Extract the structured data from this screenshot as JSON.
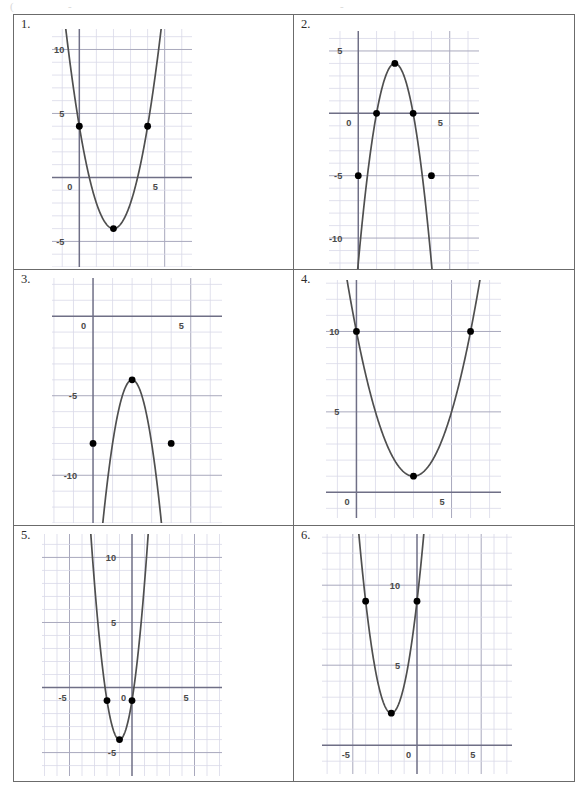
{
  "worksheet": {
    "title": "Quadratic Graphs Worksheet",
    "columns": 2,
    "rows": 3
  },
  "problems": [
    {
      "number": "1.",
      "x_labels": [
        {
          "text": "0",
          "value": 0
        },
        {
          "text": "5",
          "value": 5
        }
      ],
      "y_labels": [
        {
          "text": "10",
          "value": 10
        },
        {
          "text": "5",
          "value": 5
        },
        {
          "text": "-5",
          "value": -5
        }
      ]
    },
    {
      "number": "2.",
      "x_labels": [
        {
          "text": "0",
          "value": 0
        },
        {
          "text": "5",
          "value": 5
        }
      ],
      "y_labels": [
        {
          "text": "5",
          "value": 5
        },
        {
          "text": "-5",
          "value": -5
        },
        {
          "text": "-10",
          "value": -10
        }
      ]
    },
    {
      "number": "3.",
      "x_labels": [
        {
          "text": "0",
          "value": 0
        },
        {
          "text": "5",
          "value": 5
        }
      ],
      "y_labels": [
        {
          "text": "-5",
          "value": -5
        },
        {
          "text": "-10",
          "value": -10
        }
      ]
    },
    {
      "number": "4.",
      "x_labels": [
        {
          "text": "0",
          "value": 0
        },
        {
          "text": "5",
          "value": 5
        }
      ],
      "y_labels": [
        {
          "text": "10",
          "value": 10
        },
        {
          "text": "5",
          "value": 5
        }
      ]
    },
    {
      "number": "5.",
      "x_labels": [
        {
          "text": "-5",
          "value": -5
        },
        {
          "text": "0",
          "value": 0
        },
        {
          "text": "5",
          "value": 5
        }
      ],
      "y_labels": [
        {
          "text": "10",
          "value": 10
        },
        {
          "text": "5",
          "value": 5
        },
        {
          "text": "-5",
          "value": -5
        }
      ]
    },
    {
      "number": "6.",
      "x_labels": [
        {
          "text": "-5",
          "value": -5
        },
        {
          "text": "0",
          "value": 0
        },
        {
          "text": "5",
          "value": 5
        }
      ],
      "y_labels": [
        {
          "text": "10",
          "value": 10
        },
        {
          "text": "5",
          "value": 5
        }
      ]
    }
  ],
  "style": {
    "curve_color": "#4f4f4f",
    "point_color": "#000000",
    "axis_color": "#6f6f86",
    "major_grid_color": "#a9a9bd",
    "minor_grid_color": "#d9d9e8",
    "border_color": "#6b6b6b"
  },
  "chart_data": [
    {
      "type": "line",
      "title": "1.",
      "curve": "parabola",
      "orientation": "opens-up",
      "vertex": [
        2,
        -4
      ],
      "a": 2,
      "equation": "y = 2(x - 2)^2 - 4",
      "points": [
        [
          0,
          4
        ],
        [
          4,
          4
        ],
        [
          2,
          -4
        ]
      ],
      "xlim": [
        -1.6,
        6.6
      ],
      "ylim": [
        -7.0,
        11.6
      ],
      "xlabel": "",
      "ylabel": "",
      "grid": true,
      "grid_step": 1,
      "major_step": 5
    },
    {
      "type": "line",
      "title": "2.",
      "curve": "parabola",
      "orientation": "opens-down",
      "vertex": [
        2,
        4
      ],
      "a": -4,
      "equation": "y = -4(x - 2)^2 + 4",
      "points": [
        [
          1,
          0
        ],
        [
          3,
          0
        ],
        [
          0,
          -5
        ],
        [
          4,
          -5
        ],
        [
          2,
          4
        ]
      ],
      "xlim": [
        -1.6,
        6.6
      ],
      "ylim": [
        -12.8,
        6.6
      ],
      "xlabel": "",
      "ylabel": "",
      "grid": true,
      "grid_step": 1,
      "major_step": 5
    },
    {
      "type": "line",
      "title": "3.",
      "curve": "parabola",
      "orientation": "opens-down",
      "vertex": [
        2,
        -4
      ],
      "a": -4,
      "equation": "y = -4(x - 2)^2 - 4",
      "points": [
        [
          0,
          -8
        ],
        [
          4,
          -8
        ],
        [
          2,
          -4
        ]
      ],
      "xlim": [
        -2.1,
        6.6
      ],
      "ylim": [
        -13.0,
        2.4
      ],
      "xlabel": "",
      "ylabel": "",
      "grid": true,
      "grid_step": 1,
      "major_step": 5
    },
    {
      "type": "line",
      "title": "4.",
      "curve": "parabola",
      "orientation": "opens-up",
      "vertex": [
        3,
        1
      ],
      "a": 1,
      "equation": "y = (x - 3)^2 + 1",
      "points": [
        [
          0,
          10
        ],
        [
          6,
          10
        ],
        [
          3,
          1
        ]
      ],
      "xlim": [
        -1.6,
        7.6
      ],
      "ylim": [
        -1.6,
        13.2
      ],
      "xlabel": "",
      "ylabel": "",
      "grid": true,
      "grid_step": 1,
      "major_step": 5
    },
    {
      "type": "line",
      "title": "5.",
      "curve": "parabola",
      "orientation": "opens-up",
      "vertex": [
        -1,
        -4
      ],
      "a": 3,
      "equation": "y = 3(x + 1)^2 - 4",
      "points": [
        [
          -2,
          -1
        ],
        [
          0,
          -1
        ],
        [
          -1,
          -4
        ]
      ],
      "xlim": [
        -7.2,
        7.2
      ],
      "ylim": [
        -6.8,
        11.8
      ],
      "xlabel": "",
      "ylabel": "",
      "grid": true,
      "grid_step": 1,
      "major_step": 5
    },
    {
      "type": "line",
      "title": "6.",
      "curve": "parabola",
      "orientation": "opens-up",
      "vertex": [
        -2,
        2
      ],
      "a": 1.75,
      "equation": "y = 1.75(x + 2)^2 + 2",
      "points": [
        [
          -4,
          9
        ],
        [
          0,
          9
        ],
        [
          -2,
          2
        ]
      ],
      "xlim": [
        -7.4,
        7.4
      ],
      "ylim": [
        -1.8,
        13.2
      ],
      "xlabel": "",
      "ylabel": "",
      "grid": true,
      "grid_step": 1,
      "major_step": 5
    }
  ]
}
